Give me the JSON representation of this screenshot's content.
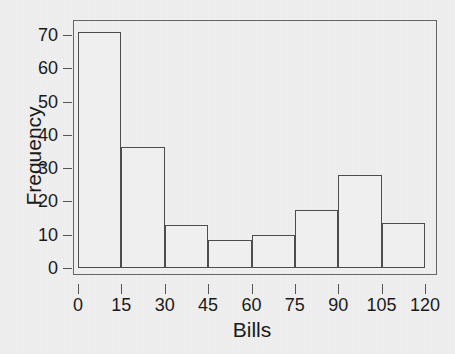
{
  "chart_data": {
    "type": "bar",
    "title": "",
    "subtitle": "",
    "xlabel": "Bills",
    "ylabel": "Frequency",
    "categories": [
      "0-15",
      "15-30",
      "30-45",
      "45-60",
      "60-75",
      "75-90",
      "90-105",
      "105-120"
    ],
    "bin_edges": [
      0,
      15,
      30,
      45,
      60,
      75,
      90,
      105,
      120
    ],
    "values": [
      71,
      36.5,
      13,
      8.5,
      10,
      17.5,
      28,
      13.5
    ],
    "bars": [
      {
        "label": "0-15",
        "x0": 0,
        "x1": 15,
        "value": 71
      },
      {
        "label": "15-30",
        "x0": 15,
        "x1": 30,
        "value": 36.5
      },
      {
        "label": "30-45",
        "x0": 30,
        "x1": 45,
        "value": 13
      },
      {
        "label": "45-60",
        "x0": 45,
        "x1": 60,
        "value": 8.5
      },
      {
        "label": "60-75",
        "x0": 60,
        "x1": 75,
        "value": 10
      },
      {
        "label": "75-90",
        "x0": 75,
        "x1": 90,
        "value": 17.5
      },
      {
        "label": "90-105",
        "x0": 90,
        "x1": 105,
        "value": 28
      },
      {
        "label": "105-120",
        "x0": 105,
        "x1": 120,
        "value": 13.5
      }
    ],
    "xlim": [
      0,
      120
    ],
    "ylim": [
      0,
      76.5
    ],
    "xticks": [
      0,
      15,
      30,
      45,
      60,
      75,
      90,
      105,
      120
    ],
    "xtick_labels": [
      "0",
      "15",
      "30",
      "45",
      "60",
      "75",
      "90",
      "105",
      "120"
    ],
    "yticks": [
      0,
      10,
      20,
      30,
      40,
      50,
      60,
      70
    ],
    "ytick_labels": [
      "0",
      "10",
      "20",
      "30",
      "40",
      "50",
      "60",
      "70"
    ],
    "grid": false,
    "legend": null,
    "legend_position": "none",
    "annotations": [],
    "colors": {
      "background": "#efefef",
      "bar_edge": "#4d4d4d",
      "bar_fill": "none",
      "axis": "#666666",
      "text": "#1a1a1a"
    }
  }
}
